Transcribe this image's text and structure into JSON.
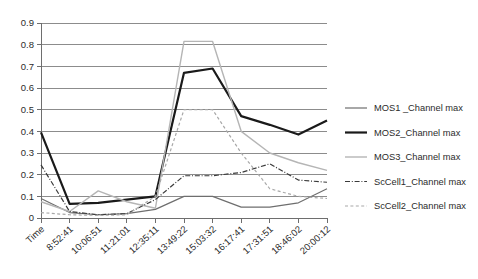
{
  "chart_data": {
    "type": "line",
    "title": "",
    "xlabel": "",
    "ylabel": "",
    "ylim": [
      0,
      0.9
    ],
    "yticks": [
      "0",
      "0.1",
      "0.2",
      "0.3",
      "0.4",
      "0.5",
      "0.6",
      "0.7",
      "0.8",
      "0.9"
    ],
    "ytick_values": [
      0,
      0.1,
      0.2,
      0.3,
      0.4,
      0.5,
      0.6,
      0.7,
      0.8,
      0.9
    ],
    "grid": true,
    "legend_position": "right",
    "categories": [
      "Time",
      "8:52:41",
      "10:06:51",
      "11:21:01",
      "12:35:11",
      "13:49:22",
      "15:03:32",
      "16:17:41",
      "17:31:51",
      "18:46:02",
      "20:00:12"
    ],
    "series": [
      {
        "name": "MOS1 _Channel max",
        "color": "#6e6e6e",
        "style": "solid",
        "width": 1.2,
        "values": [
          0.09,
          0.025,
          0.015,
          0.02,
          0.04,
          0.1,
          0.1,
          0.05,
          0.05,
          0.07,
          0.135
        ]
      },
      {
        "name": "MOS2_Channel max",
        "color": "#1a1a1a",
        "style": "solid",
        "width": 2.2,
        "values": [
          0.395,
          0.065,
          0.07,
          0.085,
          0.1,
          0.67,
          0.69,
          0.47,
          0.43,
          0.385,
          0.45
        ]
      },
      {
        "name": "MOS3_Channel max",
        "color": "#b5b5b5",
        "style": "solid",
        "width": 1.4,
        "values": [
          0.075,
          0.03,
          0.125,
          0.075,
          0.045,
          0.815,
          0.815,
          0.4,
          0.3,
          0.255,
          0.22
        ]
      },
      {
        "name": "ScCell1_Channel max",
        "color": "#3a3a3a",
        "style": "dashdot",
        "width": 1.2,
        "values": [
          0.245,
          0.03,
          0.015,
          0.02,
          0.085,
          0.195,
          0.195,
          0.21,
          0.25,
          0.175,
          0.165
        ]
      },
      {
        "name": "ScCell2_Channel max",
        "color": "#a8a8a8",
        "style": "dashed",
        "width": 1.2,
        "values": [
          0.025,
          0.015,
          0.012,
          0.015,
          0.1,
          0.5,
          0.5,
          0.3,
          0.135,
          0.1,
          0.09
        ]
      }
    ]
  },
  "legend": {
    "items": [
      {
        "label": "MOS1 _Channel max"
      },
      {
        "label": "MOS2_Channel max"
      },
      {
        "label": "MOS3_Channel max"
      },
      {
        "label": "ScCell1_Channel max"
      },
      {
        "label": "ScCell2_Channel max"
      }
    ]
  }
}
